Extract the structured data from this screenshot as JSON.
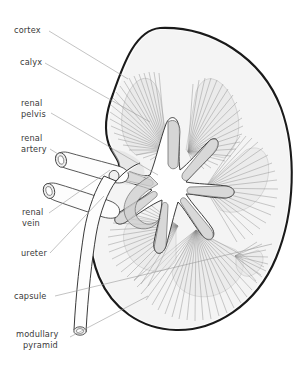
{
  "figure": {
    "background_color": "#ffffff",
    "outline_color": "#1a1a1a",
    "label_color": "#3a3a3a",
    "leader_color": "#9a9a9a",
    "pyramid_color": "#8d8d8d",
    "calyx_fill": "#cfcfcf",
    "cortex_fill": "#f4f4f4"
  },
  "labels": [
    {
      "id": "cortex",
      "text": "cortex",
      "x": 14,
      "y": 33
    },
    {
      "id": "calyx",
      "text": "calyx",
      "x": 20,
      "y": 65
    },
    {
      "id": "renal-pelvis-1",
      "text": "renal",
      "x": 21,
      "y": 106
    },
    {
      "id": "renal-pelvis-2",
      "text": "pelvis",
      "x": 21,
      "y": 117
    },
    {
      "id": "renal-artery-1",
      "text": "renal",
      "x": 21,
      "y": 141
    },
    {
      "id": "renal-artery-2",
      "text": "artery",
      "x": 21,
      "y": 152
    },
    {
      "id": "renal-vein-1",
      "text": "renal",
      "x": 22,
      "y": 215
    },
    {
      "id": "renal-vein-2",
      "text": "vein",
      "x": 22,
      "y": 226
    },
    {
      "id": "ureter",
      "text": "ureter",
      "x": 21,
      "y": 256
    },
    {
      "id": "capsule",
      "text": "capsule",
      "x": 14,
      "y": 299
    },
    {
      "id": "modullary-1",
      "text": "modullary",
      "x": 16,
      "y": 337
    },
    {
      "id": "modullary-2",
      "text": "pyramid",
      "x": 23,
      "y": 348
    }
  ],
  "structures": [
    {
      "id": "cortex",
      "name": "renal cortex"
    },
    {
      "id": "calyx",
      "name": "calyx"
    },
    {
      "id": "renal-pelvis",
      "name": "renal pelvis"
    },
    {
      "id": "renal-artery",
      "name": "renal artery"
    },
    {
      "id": "renal-vein",
      "name": "renal vein"
    },
    {
      "id": "ureter",
      "name": "ureter"
    },
    {
      "id": "capsule",
      "name": "renal capsule"
    },
    {
      "id": "medullary-pyramid",
      "name": "medullary pyramid"
    }
  ]
}
